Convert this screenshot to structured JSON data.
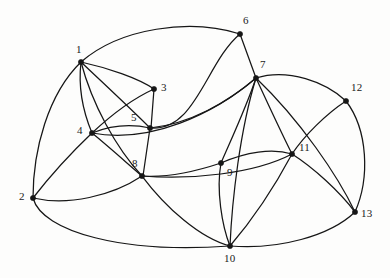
{
  "figure": {
    "type": "planar-graph-diagram",
    "background_color": "#fdfdfc",
    "edge_color": "#161616",
    "vertex_color": "#161616",
    "width": 390,
    "height": 278
  },
  "vertices": [
    {
      "id": "1",
      "label": "1",
      "x": 81,
      "y": 62,
      "label_x": 76,
      "label_y": 44
    },
    {
      "id": "2",
      "label": "2",
      "x": 33,
      "y": 198,
      "label_x": 19,
      "label_y": 191
    },
    {
      "id": "3",
      "label": "3",
      "x": 154,
      "y": 89,
      "label_x": 161,
      "label_y": 82
    },
    {
      "id": "4",
      "label": "4",
      "x": 92,
      "y": 133,
      "label_x": 77,
      "label_y": 125
    },
    {
      "id": "5",
      "label": "5",
      "x": 150,
      "y": 128,
      "label_x": 131,
      "label_y": 112
    },
    {
      "id": "6",
      "label": "6",
      "x": 240,
      "y": 34,
      "label_x": 243,
      "label_y": 15
    },
    {
      "id": "7",
      "label": "7",
      "x": 256,
      "y": 78,
      "label_x": 260,
      "label_y": 59
    },
    {
      "id": "8",
      "label": "8",
      "x": 142,
      "y": 176,
      "label_x": 132,
      "label_y": 158
    },
    {
      "id": "9",
      "label": "9",
      "x": 221,
      "y": 163,
      "label_x": 227,
      "label_y": 167
    },
    {
      "id": "10",
      "label": "10",
      "x": 230,
      "y": 246,
      "label_x": 224,
      "label_y": 253
    },
    {
      "id": "11",
      "label": "11",
      "x": 292,
      "y": 154,
      "label_x": 299,
      "label_y": 142
    },
    {
      "id": "12",
      "label": "12",
      "x": 346,
      "y": 101,
      "label_x": 351,
      "label_y": 82
    },
    {
      "id": "13",
      "label": "13",
      "x": 355,
      "y": 212,
      "label_x": 361,
      "label_y": 208
    }
  ],
  "edges": [
    {
      "name": "edge-1-6",
      "from": "1",
      "to": "6",
      "path": "M 81 62 C 120 28 190 18 240 34"
    },
    {
      "name": "edge-1-2",
      "from": "1",
      "to": "2",
      "path": "M 81 62 C 48 94 33 150 33 198"
    },
    {
      "name": "edge-1-3",
      "from": "1",
      "to": "3",
      "path": "M 81 62 C 108 68 138 78 154 89"
    },
    {
      "name": "edge-1-4",
      "from": "1",
      "to": "4",
      "path": "M 81 62 C 78 88 84 114 92 133"
    },
    {
      "name": "edge-1-5",
      "from": "1",
      "to": "5",
      "path": "M 81 62 C 102 82 130 108 150 128"
    },
    {
      "name": "edge-1-8",
      "from": "1",
      "to": "8",
      "path": "M 81 62 C 92 104 116 148 142 176"
    },
    {
      "name": "edge-2-4",
      "from": "2",
      "to": "4",
      "path": "M 33 198 C 50 176 72 152 92 133"
    },
    {
      "name": "edge-2-8",
      "from": "2",
      "to": "8",
      "path": "M 33 198 C 68 206 112 196 142 176"
    },
    {
      "name": "edge-2-10",
      "from": "2",
      "to": "10",
      "path": "M 33 198 C 42 232 124 254 230 246"
    },
    {
      "name": "edge-3-5",
      "from": "3",
      "to": "5",
      "path": "M 154 89 L 151 128"
    },
    {
      "name": "edge-4-5",
      "from": "4",
      "to": "5",
      "path": "M 92 133 C 112 125 132 124 150 128"
    },
    {
      "name": "edge-4-3alt",
      "from": "4",
      "to": "3",
      "path": "M 92 133 C 108 118 132 99 154 89"
    },
    {
      "name": "edge-4-8",
      "from": "4",
      "to": "8",
      "path": "M 92 133 C 108 146 128 164 142 176"
    },
    {
      "name": "edge-4-7",
      "from": "4",
      "to": "7",
      "path": "M 92 133 C 150 144 214 114 256 78"
    },
    {
      "name": "edge-5-8",
      "from": "5",
      "to": "8",
      "path": "M 150 128 L 143 176"
    },
    {
      "name": "edge-5-6",
      "from": "5",
      "to": "6",
      "path": "M 150 128 C 196 132 206 62 240 34"
    },
    {
      "name": "edge-5-7",
      "from": "5",
      "to": "7",
      "path": "M 150 128 C 190 124 228 102 256 78"
    },
    {
      "name": "edge-6-7",
      "from": "6",
      "to": "7",
      "path": "M 240 34 L 256 78"
    },
    {
      "name": "edge-7-9",
      "from": "7",
      "to": "9",
      "path": "M 256 78 C 246 108 230 142 221 163"
    },
    {
      "name": "edge-7-10",
      "from": "7",
      "to": "10",
      "path": "M 256 78 C 240 130 232 200 230 246"
    },
    {
      "name": "edge-7-11",
      "from": "7",
      "to": "11",
      "path": "M 256 78 C 268 104 282 134 292 154"
    },
    {
      "name": "edge-7-12",
      "from": "7",
      "to": "12",
      "path": "M 256 78 C 288 68 326 82 346 101"
    },
    {
      "name": "edge-7-13",
      "from": "7",
      "to": "13",
      "path": "M 256 78 C 300 120 338 176 355 212"
    },
    {
      "name": "edge-8-9",
      "from": "8",
      "to": "9",
      "path": "M 142 176 C 170 178 200 170 221 163"
    },
    {
      "name": "edge-8-11",
      "from": "8",
      "to": "11",
      "path": "M 142 176 C 190 180 254 174 292 154"
    },
    {
      "name": "edge-8-10",
      "from": "8",
      "to": "10",
      "path": "M 142 176 C 166 208 200 238 230 246"
    },
    {
      "name": "edge-9-10",
      "from": "9",
      "to": "10",
      "path": "M 221 163 C 216 190 222 226 230 246"
    },
    {
      "name": "edge-9-11",
      "from": "9",
      "to": "11",
      "path": "M 221 163 C 246 152 272 148 292 154"
    },
    {
      "name": "edge-10-11",
      "from": "10",
      "to": "11",
      "path": "M 230 246 C 254 218 276 184 292 154"
    },
    {
      "name": "edge-10-13",
      "from": "10",
      "to": "13",
      "path": "M 230 246 C 278 250 330 236 355 212"
    },
    {
      "name": "edge-11-12",
      "from": "11",
      "to": "12",
      "path": "M 292 154 C 304 136 326 114 346 101"
    },
    {
      "name": "edge-11-13",
      "from": "11",
      "to": "13",
      "path": "M 292 154 C 314 168 340 192 355 212"
    },
    {
      "name": "edge-12-13",
      "from": "12",
      "to": "13",
      "path": "M 346 101 C 368 130 370 178 355 212"
    }
  ]
}
